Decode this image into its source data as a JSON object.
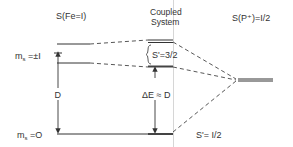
{
  "diagram": {
    "columns": {
      "left_title": "S(Fe=I)",
      "center_title_line1": "Coupled",
      "center_title_line2": "System",
      "right_title": "S(P⁺)=I/2"
    },
    "left_levels": {
      "upper_label_prefix": "m",
      "upper_label_sub": "s",
      "upper_label_value": " =±I",
      "lower_label_prefix": "m",
      "lower_label_sub": "s",
      "lower_label_value": " =O",
      "splitting_label": "D"
    },
    "center_levels": {
      "upper_manifold_label": "S'=3/2",
      "gap_label": "ΔE ≈ D",
      "lower_level_label": "S'= I/2"
    },
    "colors": {
      "line": "#333333",
      "guide": "#bbbbbb"
    }
  }
}
